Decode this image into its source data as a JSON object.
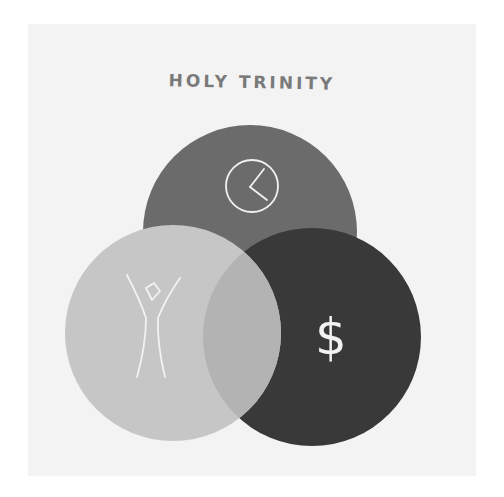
{
  "title": "HOLY TRINITY",
  "diagram": {
    "type": "venn",
    "sets": [
      {
        "id": "time",
        "icon": "clock-icon",
        "color": "#6b6b6b",
        "position": "top"
      },
      {
        "id": "self",
        "icon": "person-icon",
        "color": "#c6c6c6",
        "position": "bottom-left"
      },
      {
        "id": "money",
        "icon": "dollar-icon",
        "glyph": "$",
        "color": "#393939",
        "position": "bottom-right"
      }
    ],
    "overlap_color": "#b3b3b3"
  },
  "colors": {
    "background": "#f3f3f3",
    "title": "#7a7a7a",
    "icon_stroke": "#f2f2f2"
  }
}
